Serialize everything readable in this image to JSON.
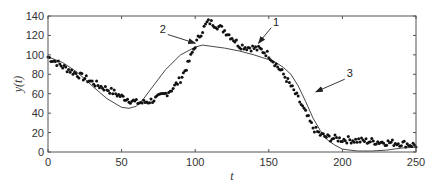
{
  "chart_data": {
    "type": "line",
    "title": "",
    "xlabel": "t",
    "ylabel": "y(t)",
    "xlim": [
      0,
      250
    ],
    "ylim": [
      0,
      140
    ],
    "xticks": [
      0,
      50,
      100,
      150,
      200,
      250
    ],
    "yticks": [
      0,
      20,
      40,
      60,
      80,
      100,
      120,
      140
    ],
    "grid": false,
    "legend": null,
    "series": [
      {
        "name": "1",
        "style": "markers",
        "color": "#111111",
        "x": [
          0,
          5,
          10,
          15,
          20,
          25,
          30,
          35,
          40,
          45,
          50,
          55,
          60,
          65,
          70,
          75,
          80,
          85,
          90,
          95,
          100,
          103,
          106,
          108,
          110,
          115,
          120,
          125,
          130,
          135,
          140,
          145,
          150,
          155,
          160,
          165,
          170,
          175,
          180,
          185,
          190,
          195,
          200,
          210,
          220,
          230,
          240,
          250
        ],
        "values": [
          98,
          93,
          88,
          84,
          80,
          76,
          72,
          68,
          65,
          61,
          57,
          54,
          51,
          51,
          53,
          56,
          60,
          66,
          75,
          90,
          110,
          120,
          128,
          133,
          134,
          130,
          125,
          118,
          110,
          108,
          107,
          105,
          100,
          90,
          80,
          68,
          55,
          40,
          25,
          18,
          15,
          14,
          13,
          12,
          11,
          10,
          9,
          7
        ]
      },
      {
        "name": "3",
        "style": "line",
        "color": "#333333",
        "x": [
          0,
          10,
          20,
          30,
          40,
          50,
          55,
          60,
          65,
          70,
          75,
          80,
          90,
          100,
          105,
          110,
          120,
          130,
          140,
          150,
          155,
          160,
          165,
          170,
          175,
          180,
          185,
          190,
          195,
          200,
          210,
          220,
          230,
          240,
          250
        ],
        "values": [
          98,
          92,
          82,
          68,
          55,
          46,
          45,
          47,
          55,
          65,
          75,
          85,
          100,
          108,
          110,
          109,
          107,
          104,
          100,
          95,
          92,
          87,
          80,
          68,
          52,
          35,
          22,
          12,
          7,
          3,
          1,
          1,
          2,
          4,
          5
        ]
      }
    ],
    "annotations": [
      {
        "text": "1",
        "label_xy": [
          155,
          130
        ],
        "arrow_to": [
          143,
          112
        ]
      },
      {
        "text": "2",
        "label_xy": [
          78,
          123
        ],
        "arrow_to": [
          100,
          112
        ]
      },
      {
        "text": "3",
        "label_xy": [
          205,
          77
        ],
        "arrow_to": [
          182,
          62
        ]
      }
    ]
  }
}
